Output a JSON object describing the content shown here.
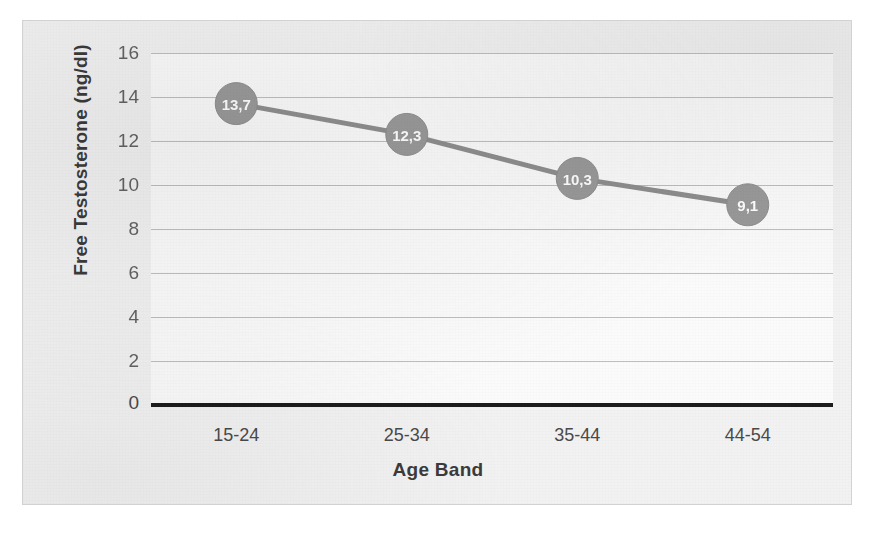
{
  "chart_data": {
    "type": "line",
    "title": "",
    "xlabel": "Age Band",
    "ylabel": "Free Testosterone (ng/dl)",
    "categories": [
      "15-24",
      "25-34",
      "35-44",
      "44-54"
    ],
    "values": [
      13.7,
      12.3,
      10.3,
      9.1
    ],
    "point_labels": [
      "13,7",
      "12,3",
      "10,3",
      "9,1"
    ],
    "ylim": [
      0,
      16
    ],
    "y_ticks": [
      0,
      2,
      4,
      6,
      8,
      10,
      12,
      14,
      16
    ],
    "y_tick_labels": [
      "0",
      "2",
      "4",
      "6",
      "8",
      "10",
      "12",
      "14",
      "16"
    ],
    "grid": true,
    "grid_axis": "y",
    "legend": "none",
    "decimal_separator": ",",
    "series": [
      {
        "name": "Free Testosterone",
        "values": [
          13.7,
          12.3,
          10.3,
          9.1
        ]
      }
    ],
    "colors": {
      "line": "#8f8f8f",
      "marker": "#9a9a9a",
      "marker_label": "#ffffff",
      "gridline": "#b4b4b4",
      "baseline": "#1c1c1c",
      "axis_text": "#4a4a4a",
      "title_text": "#3b3b3b",
      "frame_border": "#d2d2d2",
      "frame_background": "#f2f2f2",
      "plot_background": "#fbfbfb"
    }
  }
}
